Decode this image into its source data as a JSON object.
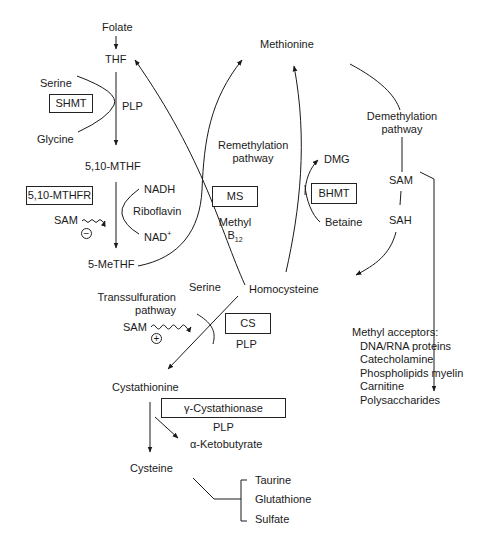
{
  "diagram": {
    "nodes": {
      "folate": "Folate",
      "thf": "THF",
      "serine_top": "Serine",
      "glycine": "Glycine",
      "plp_shmt": "PLP",
      "mthf_510": "5,10-MTHF",
      "nadh": "NADH",
      "riboflavin": "Riboflavin",
      "nad": "NAD",
      "nad_sup": "+",
      "sam_left": "SAM",
      "me_thf": "5-MeTHF",
      "methionine": "Methionine",
      "remethylation_1": "Remethylation",
      "remethylation_2": "pathway",
      "methyl": "Methyl",
      "b12_base": "B",
      "b12_sub": "12",
      "dmg": "DMG",
      "betaine": "Betaine",
      "demethylation_1": "Demethylation",
      "demethylation_2": "pathway",
      "sam_right": "SAM",
      "sah": "SAH",
      "homocysteine": "Homocysteine",
      "serine_mid": "Serine",
      "transsulfuration_1": "Transsulfuration",
      "transsulfuration_2": "pathway",
      "sam_cs": "SAM",
      "plp_cs": "PLP",
      "cystathionine": "Cystathionine",
      "plp_cgl": "PLP",
      "ketobutyrate": "α-Ketobutyrate",
      "cysteine": "Cysteine"
    },
    "enzymes": {
      "shmt": "SHMT",
      "mthfr": "5,10-MTHFR",
      "ms": "MS",
      "bhmt": "BHMT",
      "cs": "CS",
      "cgl": "γ-Cystathionase"
    },
    "regulators": {
      "mthfr_inhibition": "⊖",
      "cs_activation": "⊕"
    },
    "methyl_acceptors": {
      "heading": "Methyl acceptors:",
      "items": [
        "DNA/RNA proteins",
        "Catecholamine",
        "Phospholipids myelin",
        "Carnitine",
        "Polysaccharides"
      ]
    },
    "cysteine_products": [
      "Taurine",
      "Glutathione",
      "Sulfate"
    ]
  }
}
